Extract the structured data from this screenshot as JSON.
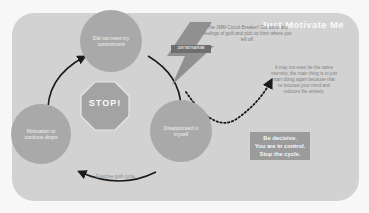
{
  "header": {
    "title": "Just Motivate Me"
  },
  "cycle": {
    "nodes": [
      {
        "id": "top",
        "label": "Did not meet my commitment"
      },
      {
        "id": "right",
        "label": "Disappointed in myself"
      },
      {
        "id": "left",
        "label": "Motivation to continue drops"
      }
    ],
    "bottom_label": "Exercise guilt cycle.",
    "stop_sign": {
      "label": "STOP!"
    }
  },
  "lightning": {
    "label": "JUST MOTIVATE ME"
  },
  "annotations": {
    "revenge": "The JMM Circuit Breaker! Set aside any feelings of guilt and pick up from where you left off.",
    "side_note": "It may not even be the same intensity, the main thing is to just start doing again because that re-focuses your mind and reduces the anxiety."
  },
  "callout": {
    "lines": [
      "Be decisive.",
      "You are in control.",
      "Stop the cycle."
    ]
  },
  "colors": {
    "background": "#f7f7f7",
    "panel": "#d2d2d2",
    "node": "#a9a9a9",
    "stop_sign": "#a3a3a3",
    "lightning": "#8a8a8a",
    "callout": "#9b9b9b",
    "arrow": "#1a1a1a"
  }
}
